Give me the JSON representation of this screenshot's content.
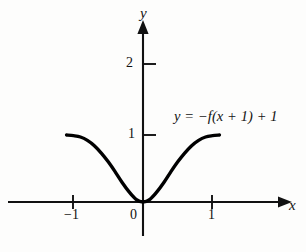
{
  "figure": {
    "background_color": "#fdfdfc",
    "ink_color": "#111111",
    "curve_color": "#000000"
  },
  "axes": {
    "x_letter": "x",
    "y_letter": "y",
    "origin_label": "0"
  },
  "annotations": {
    "equation": "y = −f(x + 1) + 1"
  },
  "chart_data": {
    "type": "line",
    "title": "",
    "subtitle": "",
    "xlabel": "x",
    "ylabel": "y",
    "xlim": [
      -1.95,
      2.35
    ],
    "ylim": [
      -0.48,
      2.75
    ],
    "xticks": [
      -1,
      1
    ],
    "xticklabels": [
      "−1",
      "1"
    ],
    "yticks": [
      1,
      2
    ],
    "yticklabels": [
      "1",
      "2"
    ],
    "origin_tick_label": "0",
    "grid": false,
    "legend": false,
    "annotations": [
      {
        "text": "y = −f(x + 1) + 1",
        "x": 0.45,
        "y": 1.22
      }
    ],
    "series": [
      {
        "name": "y = -f(x + 1) + 1",
        "comment": "Symmetric S-shaped valley; tangential minimum at the origin, flattening to y = 1 near x = ±1.1",
        "x": [
          -1.1,
          -1.0,
          -0.9,
          -0.8,
          -0.7,
          -0.6,
          -0.5,
          -0.4,
          -0.3,
          -0.2,
          -0.1,
          0.0,
          0.1,
          0.2,
          0.3,
          0.4,
          0.5,
          0.6,
          0.7,
          0.8,
          0.9,
          1.0,
          1.1
        ],
        "values": [
          1.0,
          0.99,
          0.97,
          0.92,
          0.84,
          0.73,
          0.6,
          0.45,
          0.29,
          0.15,
          0.04,
          0.0,
          0.04,
          0.15,
          0.29,
          0.45,
          0.6,
          0.73,
          0.84,
          0.92,
          0.97,
          0.99,
          1.0
        ]
      }
    ]
  }
}
